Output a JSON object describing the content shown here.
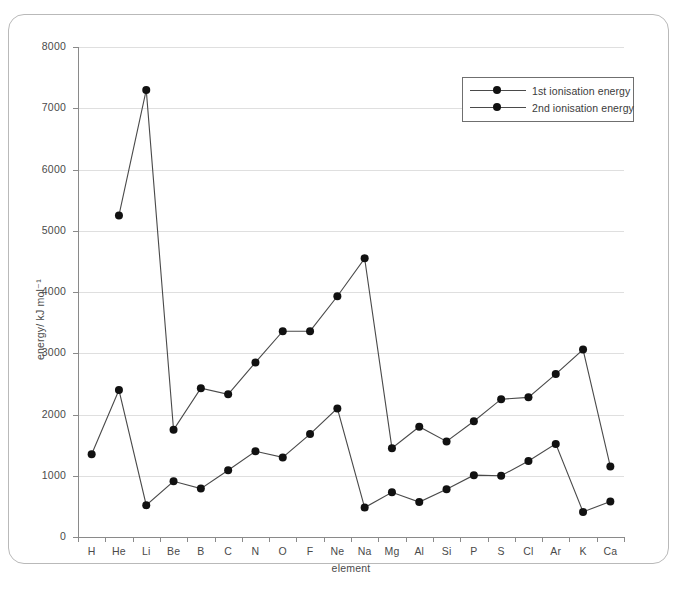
{
  "chart_data": {
    "type": "line",
    "title": "",
    "xlabel": "element",
    "ylabel": "energy/ kJ mol⁻¹",
    "ylim": [
      0,
      8000
    ],
    "grid": true,
    "legend_position": "top-right",
    "y_ticks": [
      0,
      1000,
      2000,
      3000,
      4000,
      5000,
      6000,
      7000,
      8000
    ],
    "y_tick_labels": [
      "0",
      "1000",
      "2000",
      "3000",
      "4000",
      "5000",
      "6000",
      "7000",
      "8000"
    ],
    "categories": [
      "H",
      "He",
      "Li",
      "Be",
      "B",
      "C",
      "N",
      "O",
      "F",
      "Ne",
      "Na",
      "Mg",
      "Al",
      "Si",
      "P",
      "S",
      "Cl",
      "Ar",
      "K",
      "Ca"
    ],
    "series": [
      {
        "name": "1st ionisation energy",
        "color": "#111111",
        "values": [
          1350,
          2400,
          520,
          910,
          790,
          1090,
          1400,
          1300,
          1680,
          2100,
          480,
          730,
          570,
          780,
          1010,
          1000,
          1240,
          1520,
          410,
          580
        ]
      },
      {
        "name": "2nd ionisation energy",
        "color": "#111111",
        "values": [
          null,
          5250,
          7300,
          1750,
          2430,
          2330,
          2850,
          3360,
          3360,
          3930,
          4550,
          1450,
          1800,
          1560,
          1890,
          2250,
          2280,
          2660,
          3060,
          1150
        ]
      }
    ]
  },
  "legend": {
    "entries": [
      {
        "label": "1st ionisation energy"
      },
      {
        "label": "2nd ionisation energy"
      }
    ]
  },
  "colors": {
    "line": "#4a4a4a",
    "marker": "#111111",
    "grid": "#dfdfdf",
    "axis": "#8a8a8a",
    "frame": "#b9b9b9",
    "text": "#4a4a4a"
  }
}
